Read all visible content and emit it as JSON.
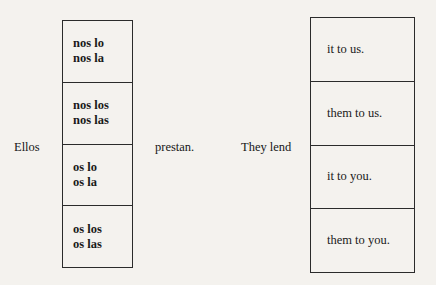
{
  "diagram": {
    "type": "grammar-substitution-chart",
    "background_color": "#f4f2ee",
    "text_color": "#171717",
    "border_color": "#2b2b2b"
  },
  "spanish_clause": {
    "subject_label": "Ellos",
    "verb_label": "prestan.",
    "pronoun_options": [
      {
        "line1": "nos lo",
        "line2": "nos la"
      },
      {
        "line1": "nos los",
        "line2": "nos las"
      },
      {
        "line1": "os lo",
        "line2": "os la"
      },
      {
        "line1": "os los",
        "line2": "os las"
      }
    ]
  },
  "english_clause": {
    "verb_label": "They lend",
    "object_options": [
      {
        "line1": "it to us."
      },
      {
        "line1": "them to us."
      },
      {
        "line1": "it to you."
      },
      {
        "line1": "them to you."
      }
    ]
  }
}
